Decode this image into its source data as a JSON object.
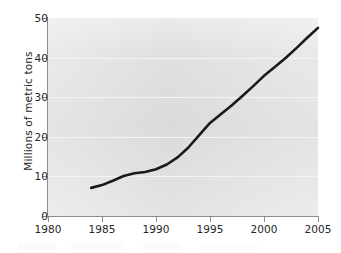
{
  "chart_data": {
    "type": "line",
    "title": "",
    "subtitle": "",
    "xlabel": "",
    "ylabel": "Millions of metric tons",
    "xlim": [
      1980,
      2005
    ],
    "ylim": [
      0,
      50
    ],
    "grid": "horizontal",
    "legend": "none",
    "background": "#e4e4e4",
    "line_color": "#1a1a1a",
    "axis_color": "#8d8d8d",
    "text_color": "#262626",
    "xticks": [
      "1980",
      "1985",
      "1990",
      "1995",
      "2000",
      "2005"
    ],
    "yticks": [
      "0",
      "10",
      "20",
      "30",
      "40",
      "50"
    ],
    "series": [
      {
        "name": "",
        "x": [
          1984,
          1985,
          1986,
          1987,
          1988,
          1989,
          1990,
          1991,
          1992,
          1993,
          1994,
          1995,
          1996,
          1997,
          1998,
          1999,
          2000,
          2001,
          2002,
          2003,
          2004,
          2005
        ],
        "values": [
          7.1,
          7.8,
          8.9,
          10.1,
          10.8,
          11.1,
          11.8,
          13.0,
          14.8,
          17.3,
          20.4,
          23.5,
          25.7,
          27.9,
          30.3,
          32.8,
          35.4,
          37.6,
          39.9,
          42.4,
          45.0,
          47.5
        ]
      }
    ]
  }
}
